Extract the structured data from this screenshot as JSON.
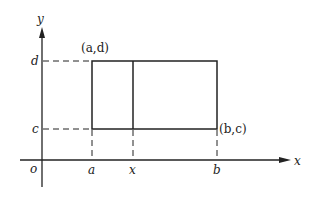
{
  "diagram": {
    "axes": {
      "x_label": "x",
      "y_label": "y",
      "origin_label": "o"
    },
    "y_ticks": {
      "top": "d",
      "bottom": "c"
    },
    "x_ticks": {
      "left": "a",
      "middle": "x",
      "right": "b"
    },
    "corner_labels": {
      "top_left": "(a,d)",
      "bottom_right": "(b,c)"
    },
    "colors": {
      "stroke": "#222222",
      "background": "#ffffff"
    }
  }
}
